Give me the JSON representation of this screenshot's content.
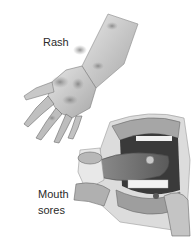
{
  "figure": {
    "labels": {
      "rash": "Rash",
      "mouth_line1": "Mouth",
      "mouth_line2": "sores"
    },
    "illustrations": [
      {
        "name": "hand-with-rash",
        "style": "grayscale pencil illustration"
      },
      {
        "name": "open-mouth-with-sores",
        "style": "grayscale pencil illustration"
      }
    ],
    "colors": {
      "background": "#ffffff",
      "ink": "#2a2a2a"
    }
  }
}
